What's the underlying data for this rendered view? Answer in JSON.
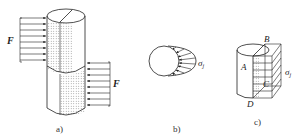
{
  "figure": {
    "panels": [
      {
        "id": "a",
        "caption": "a)",
        "description": "Cylinder subjected to opposing transverse distributed forces (shear) on upper and lower halves",
        "labels": {
          "force": "F",
          "force_lower": "F"
        }
      },
      {
        "id": "b",
        "caption": "b)",
        "description": "Cross-section showing bearing stress distribution on half of circular contact",
        "labels": {
          "stress": "σ",
          "stress_sub": "j"
        }
      },
      {
        "id": "c",
        "caption": "c)",
        "description": "Half-cylinder with projected rectangular area ABCD carrying uniform bearing stress",
        "labels": {
          "A": "A",
          "B": "B",
          "C": "C",
          "D": "D",
          "stress": "σ",
          "stress_sub": "j"
        }
      }
    ],
    "colors": {
      "line": "#222222",
      "hatch": "#555555",
      "background": "#ffffff"
    }
  }
}
